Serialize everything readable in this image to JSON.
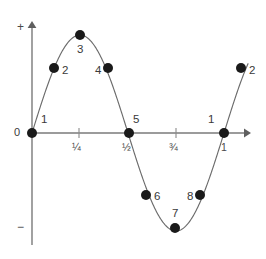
{
  "chart_data": {
    "type": "line",
    "title": "",
    "subtitle": "",
    "xlabel": "",
    "ylabel": "",
    "curve": {
      "function": "sin(2*pi*x)",
      "x_start": 0,
      "x_end": 1.125,
      "amplitude": 1,
      "periods": 1.125,
      "color": "#6b6b6b",
      "line_width": 1
    },
    "x": [
      0,
      0.125,
      0.25,
      0.375,
      0.5,
      0.625,
      0.75,
      0.875,
      1.0,
      1.125
    ],
    "y": [
      0,
      0.707,
      1,
      0.707,
      0,
      -0.707,
      -1,
      -0.707,
      0,
      0.707
    ],
    "xlim": [
      0,
      1.125
    ],
    "ylim": [
      -1,
      1
    ],
    "grid": false,
    "legend": false,
    "x_ticks": [
      {
        "value": 0.25,
        "label": "¼"
      },
      {
        "value": 0.5,
        "label": "½"
      },
      {
        "value": 0.75,
        "label": "¾"
      },
      {
        "value": 1.0,
        "label": "1"
      }
    ],
    "y_axis_signs": {
      "positive": "+",
      "negative": "−"
    },
    "origin_label": "0",
    "points": [
      {
        "id": "p1",
        "label": "1",
        "x": 0,
        "y": 0,
        "px": 32,
        "py": 133,
        "label_px": 41,
        "label_py": 114
      },
      {
        "id": "p2",
        "label": "2",
        "x": 0.125,
        "y": 0.707,
        "px": 54,
        "py": 68,
        "label_px": 62,
        "label_py": 65
      },
      {
        "id": "p3",
        "label": "3",
        "x": 0.25,
        "y": 1,
        "px": 80,
        "py": 35,
        "label_px": 77,
        "label_py": 44
      },
      {
        "id": "p4",
        "label": "4",
        "x": 0.375,
        "y": 0.707,
        "px": 108,
        "py": 68,
        "label_px": 95,
        "label_py": 65
      },
      {
        "id": "p5",
        "label": "5",
        "x": 0.5,
        "y": 0,
        "px": 129,
        "py": 133,
        "label_px": 133,
        "label_py": 114
      },
      {
        "id": "p6",
        "label": "6",
        "x": 0.625,
        "y": -0.707,
        "px": 146,
        "py": 195,
        "label_px": 154,
        "label_py": 191
      },
      {
        "id": "p7",
        "label": "7",
        "x": 0.75,
        "y": -1,
        "px": 175,
        "py": 228,
        "label_px": 172,
        "label_py": 208
      },
      {
        "id": "p8",
        "label": "8",
        "x": 0.875,
        "y": -0.707,
        "px": 200,
        "py": 195,
        "label_px": 187,
        "label_py": 191
      },
      {
        "id": "p9",
        "label": "1",
        "x": 1.0,
        "y": 0,
        "px": 224,
        "py": 133,
        "label_px": 208,
        "label_py": 114
      },
      {
        "id": "p10",
        "label": "2",
        "x": 1.125,
        "y": 0.707,
        "px": 241,
        "py": 68,
        "label_px": 249,
        "label_py": 65
      }
    ],
    "point_style": {
      "color": "#1a1a1a",
      "radius": 5.0
    },
    "axes": {
      "x_axis_y": 133,
      "y_axis_x": 32,
      "x_axis_start": 32,
      "x_axis_end": 250,
      "y_axis_top": 22,
      "y_axis_bottom": 245,
      "color": "#7a7a7a",
      "arrow_heads": [
        "right",
        "up"
      ]
    },
    "colors": {
      "background": "#ffffff",
      "curve": "#6b6b6b",
      "axis": "#7a7a7a",
      "point": "#1a1a1a",
      "text": "#3a3a3a"
    }
  },
  "labels": {
    "plus_sign": "+",
    "minus_sign": "−",
    "origin": "0",
    "tick_quarter": "¼",
    "tick_half": "½",
    "tick_three_quarter": "¾",
    "tick_one": "1",
    "point_1": "1",
    "point_2": "2",
    "point_3": "3",
    "point_4": "4",
    "point_5": "5",
    "point_6": "6",
    "point_7": "7",
    "point_8": "8",
    "point_period_one": "1",
    "point_next_two": "2"
  }
}
